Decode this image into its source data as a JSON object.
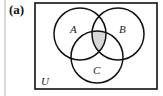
{
  "figure": {
    "panel_label": "(a)",
    "universe_label": "U",
    "sets": [
      {
        "name": "A",
        "cx": 80,
        "cy": 34,
        "r": 26
      },
      {
        "name": "B",
        "cx": 118,
        "cy": 34,
        "r": 26
      },
      {
        "name": "C",
        "cx": 97,
        "cy": 57,
        "r": 26
      }
    ],
    "shaded_region": "A ∩ B ∩ C",
    "colors": {
      "shade": "#d8d8d8",
      "stroke": "#111111",
      "frame": "#111111"
    }
  }
}
